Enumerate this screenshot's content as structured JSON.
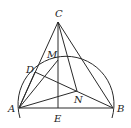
{
  "diagram": {
    "type": "geometry",
    "stroke_color": "#2a2a2a",
    "points": {
      "A": {
        "label": "A",
        "x": 19,
        "y": 108
      },
      "B": {
        "label": "B",
        "x": 113,
        "y": 108
      },
      "C": {
        "label": "C",
        "x": 58,
        "y": 22
      },
      "D": {
        "label": "D",
        "x": 35,
        "y": 72
      },
      "E": {
        "label": "E",
        "x": 58,
        "y": 108
      },
      "M": {
        "label": "M",
        "x": 58,
        "y": 60
      },
      "N": {
        "label": "N",
        "x": 77,
        "y": 91
      }
    },
    "segments": [
      "CA",
      "CB",
      "CE",
      "CN",
      "AB",
      "AM",
      "AN",
      "DB",
      "DA"
    ],
    "arc": {
      "description": "semicircular arc through A and B passing near M",
      "center_x": 66,
      "center_y": 108,
      "radius": 48
    }
  }
}
